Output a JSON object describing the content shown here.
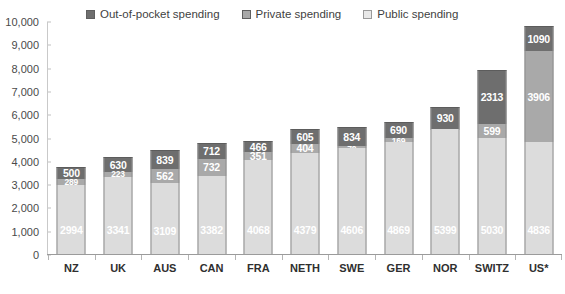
{
  "chart_data": {
    "type": "bar",
    "stacked": true,
    "title": "",
    "subtitle": "",
    "xlabel": "",
    "ylabel": "",
    "ylim": [
      0,
      10000
    ],
    "ytick_labels": [
      "10,000",
      "9,000",
      "8,000",
      "7,000",
      "6,000",
      "5,000",
      "4,000",
      "3,000",
      "2,000",
      "1,000",
      "0"
    ],
    "ytick_values": [
      10000,
      9000,
      8000,
      7000,
      6000,
      5000,
      4000,
      3000,
      2000,
      1000,
      0
    ],
    "grid": false,
    "legend_position": "top",
    "categories": [
      "NZ",
      "UK",
      "AUS",
      "CAN",
      "FRA",
      "NETH",
      "SWE",
      "GER",
      "NOR",
      "SWITZ",
      "US*"
    ],
    "series": [
      {
        "name": "Public spending",
        "color": "#dcdcdc",
        "values": [
          2994,
          3341,
          3109,
          3382,
          4068,
          4379,
          4606,
          4869,
          5399,
          5030,
          4836
        ]
      },
      {
        "name": "Private spending",
        "color": "#a9a9a9",
        "values": [
          289,
          223,
          562,
          732,
          351,
          404,
          70,
          169,
          22,
          599,
          3906
        ]
      },
      {
        "name": "Out-of-pocket spending",
        "color": "#6e6e6e",
        "values": [
          500,
          630,
          839,
          712,
          466,
          605,
          834,
          690,
          930,
          2313,
          1090
        ]
      }
    ]
  },
  "legend": {
    "items": [
      {
        "label": "Out-of-pocket spending",
        "color": "#6e6e6e",
        "swatch": "square-filled-dark"
      },
      {
        "label": "Private spending",
        "color": "#a9a9a9",
        "swatch": "square-filled-medium"
      },
      {
        "label": "Public spending",
        "color": "#e8e8e8",
        "swatch": "square-outline-light"
      }
    ]
  },
  "colors": {
    "out_of_pocket": "#6e6e6e",
    "private": "#a9a9a9",
    "public": "#dcdcdc",
    "axis": "#9b9b9b",
    "text": "#3a3a3a"
  }
}
